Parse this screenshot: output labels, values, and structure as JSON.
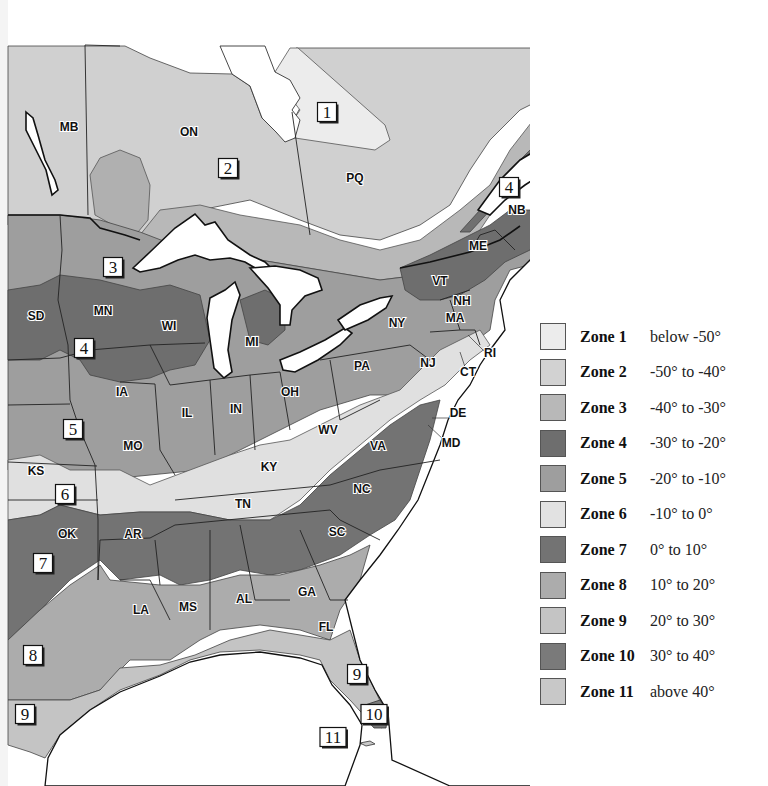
{
  "map": {
    "title": "Plant Hardiness Zones — Eastern North America",
    "provinces": [
      {
        "code": "MB",
        "x": 69,
        "y": 131
      },
      {
        "code": "ON",
        "x": 189,
        "y": 136
      },
      {
        "code": "PQ",
        "x": 355,
        "y": 182
      },
      {
        "code": "NF",
        "x": 547,
        "y": 62
      },
      {
        "code": "NB",
        "x": 517,
        "y": 214
      },
      {
        "code": "NS",
        "x": 563,
        "y": 233
      }
    ],
    "states": [
      {
        "code": "SD",
        "x": 36,
        "y": 320
      },
      {
        "code": "MN",
        "x": 103,
        "y": 315
      },
      {
        "code": "WI",
        "x": 169,
        "y": 330
      },
      {
        "code": "MI",
        "x": 252,
        "y": 346
      },
      {
        "code": "IA",
        "x": 122,
        "y": 396
      },
      {
        "code": "IL",
        "x": 187,
        "y": 417
      },
      {
        "code": "IN",
        "x": 236,
        "y": 413
      },
      {
        "code": "OH",
        "x": 290,
        "y": 396
      },
      {
        "code": "PA",
        "x": 362,
        "y": 370
      },
      {
        "code": "NY",
        "x": 397,
        "y": 327
      },
      {
        "code": "VT",
        "x": 440,
        "y": 285
      },
      {
        "code": "ME",
        "x": 478,
        "y": 250
      },
      {
        "code": "NH",
        "x": 462,
        "y": 305
      },
      {
        "code": "MA",
        "x": 455,
        "y": 322
      },
      {
        "code": "RI",
        "x": 490,
        "y": 357
      },
      {
        "code": "CT",
        "x": 468,
        "y": 376
      },
      {
        "code": "NJ",
        "x": 428,
        "y": 367
      },
      {
        "code": "DE",
        "x": 458,
        "y": 417
      },
      {
        "code": "MD",
        "x": 451,
        "y": 447
      },
      {
        "code": "WV",
        "x": 328,
        "y": 434
      },
      {
        "code": "VA",
        "x": 378,
        "y": 450
      },
      {
        "code": "KY",
        "x": 269,
        "y": 471
      },
      {
        "code": "MO",
        "x": 133,
        "y": 450
      },
      {
        "code": "KS",
        "x": 36,
        "y": 475
      },
      {
        "code": "TN",
        "x": 243,
        "y": 508
      },
      {
        "code": "NC",
        "x": 362,
        "y": 493
      },
      {
        "code": "SC",
        "x": 337,
        "y": 536
      },
      {
        "code": "OK",
        "x": 67,
        "y": 538
      },
      {
        "code": "AR",
        "x": 133,
        "y": 538
      },
      {
        "code": "LA",
        "x": 141,
        "y": 614
      },
      {
        "code": "MS",
        "x": 188,
        "y": 611
      },
      {
        "code": "AL",
        "x": 244,
        "y": 603
      },
      {
        "code": "GA",
        "x": 307,
        "y": 596
      },
      {
        "code": "FL",
        "x": 326,
        "y": 631
      }
    ],
    "zone_markers": [
      {
        "label": "1",
        "x": 327,
        "y": 112
      },
      {
        "label": "2",
        "x": 228,
        "y": 168
      },
      {
        "label": "3",
        "x": 113,
        "y": 267
      },
      {
        "label": "4",
        "x": 509,
        "y": 187
      },
      {
        "label": "4",
        "x": 84,
        "y": 348
      },
      {
        "label": "5",
        "x": 73,
        "y": 429
      },
      {
        "label": "6",
        "x": 65,
        "y": 494
      },
      {
        "label": "7",
        "x": 43,
        "y": 563
      },
      {
        "label": "8",
        "x": 33,
        "y": 655
      },
      {
        "label": "9",
        "x": 357,
        "y": 674
      },
      {
        "label": "9",
        "x": 25,
        "y": 714
      },
      {
        "label": "10",
        "x": 374,
        "y": 714
      },
      {
        "label": "11",
        "x": 333,
        "y": 737
      }
    ]
  },
  "legend": {
    "items": [
      {
        "zone": "Zone 1",
        "range": "below -50°",
        "color": "#ececec"
      },
      {
        "zone": "Zone 2",
        "range": "-50° to -40°",
        "color": "#d2d2d2"
      },
      {
        "zone": "Zone 3",
        "range": "-40° to -30°",
        "color": "#b8b8b8"
      },
      {
        "zone": "Zone 4",
        "range": "-30° to -20°",
        "color": "#6e6e6e"
      },
      {
        "zone": "Zone 5",
        "range": "-20° to -10°",
        "color": "#9e9e9e"
      },
      {
        "zone": "Zone 6",
        "range": "-10° to 0°",
        "color": "#e2e2e2"
      },
      {
        "zone": "Zone 7",
        "range": "0° to 10°",
        "color": "#737373"
      },
      {
        "zone": "Zone 8",
        "range": "10° to 20°",
        "color": "#acacac"
      },
      {
        "zone": "Zone 9",
        "range": "20° to 30°",
        "color": "#c4c4c4"
      },
      {
        "zone": "Zone 10",
        "range": "30° to 40°",
        "color": "#7a7a7a"
      },
      {
        "zone": "Zone 11",
        "range": "above 40°",
        "color": "#c8c8c8"
      }
    ]
  }
}
